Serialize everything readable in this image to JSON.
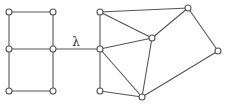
{
  "diagram": {
    "type": "graph",
    "bridge_label": "λ",
    "bridge_label_pos": {
      "x": 76,
      "y": 46
    },
    "colors": {
      "stroke": "#555555",
      "node_fill": "#ffffff",
      "label": "#333333"
    },
    "node_radius": 3,
    "nodes": [
      {
        "id": "L1",
        "x": 9,
        "y": 12
      },
      {
        "id": "L2",
        "x": 53,
        "y": 12
      },
      {
        "id": "L3",
        "x": 9,
        "y": 49
      },
      {
        "id": "L4",
        "x": 53,
        "y": 49
      },
      {
        "id": "L5",
        "x": 9,
        "y": 91
      },
      {
        "id": "L6",
        "x": 53,
        "y": 91
      },
      {
        "id": "R1",
        "x": 100,
        "y": 12
      },
      {
        "id": "R2",
        "x": 100,
        "y": 49
      },
      {
        "id": "R3",
        "x": 100,
        "y": 91
      },
      {
        "id": "R4",
        "x": 152,
        "y": 38
      },
      {
        "id": "R5",
        "x": 188,
        "y": 8
      },
      {
        "id": "R6",
        "x": 218,
        "y": 51
      },
      {
        "id": "R7",
        "x": 142,
        "y": 97
      }
    ],
    "edges": [
      [
        "L1",
        "L2"
      ],
      [
        "L1",
        "L3"
      ],
      [
        "L2",
        "L4"
      ],
      [
        "L3",
        "L4"
      ],
      [
        "L3",
        "L5"
      ],
      [
        "L4",
        "L6"
      ],
      [
        "L5",
        "L6"
      ],
      [
        "L4",
        "R2"
      ],
      [
        "R1",
        "R2"
      ],
      [
        "R2",
        "R3"
      ],
      [
        "R1",
        "R5"
      ],
      [
        "R1",
        "R4"
      ],
      [
        "R2",
        "R4"
      ],
      [
        "R2",
        "R7"
      ],
      [
        "R3",
        "R7"
      ],
      [
        "R4",
        "R5"
      ],
      [
        "R4",
        "R7"
      ],
      [
        "R5",
        "R6"
      ],
      [
        "R6",
        "R7"
      ]
    ],
    "bridge_edge": [
      "L4",
      "R2"
    ]
  }
}
